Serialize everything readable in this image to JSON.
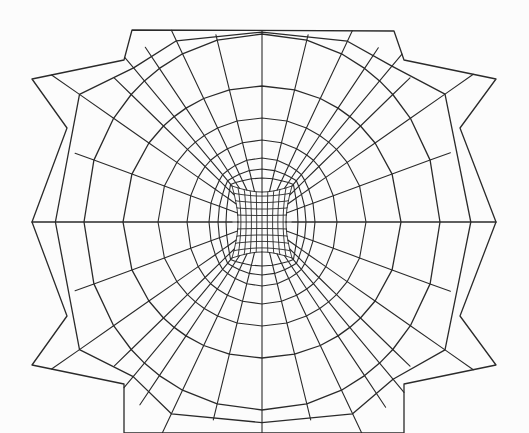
{
  "diagram": {
    "kind": "structured-mesh",
    "canvas": {
      "width": 529,
      "height": 433,
      "background": "#fcfcfc"
    },
    "stroke": {
      "color": "#2a2a2a",
      "outer_width": 1.3,
      "inner_width": 1.1,
      "core_width": 0.9
    },
    "center": {
      "x": 262,
      "y": 222
    },
    "core_block": {
      "x0": 232,
      "x1": 292,
      "y0": 186,
      "y1": 258,
      "divisions_x": 10,
      "divisions_y": 10,
      "side_bulge": 6
    },
    "rings": [
      {
        "rx": 36,
        "ry": 44,
        "squareness": 0.55
      },
      {
        "rx": 44,
        "ry": 53,
        "squareness": 0.25
      },
      {
        "rx": 53,
        "ry": 64,
        "squareness": 0.12
      },
      {
        "rx": 75,
        "ry": 82,
        "squareness": 0.05
      },
      {
        "rx": 104,
        "ry": 104,
        "squareness": 0.0
      },
      {
        "rx": 139,
        "ry": 136,
        "squareness": 0.0
      },
      {
        "rx": 178,
        "ry": 188,
        "squareness": 0.0
      }
    ],
    "spokes_per_quadrant": 8,
    "outer_boundary": {
      "points": [
        [
          32,
          79
        ],
        [
          67,
          128
        ],
        [
          32,
          222
        ],
        [
          67,
          316
        ],
        [
          32,
          365
        ],
        [
          124,
          384
        ],
        [
          124,
          433
        ],
        [
          404,
          433
        ],
        [
          404,
          384
        ],
        [
          496,
          365
        ],
        [
          460,
          316
        ],
        [
          496,
          222
        ],
        [
          460,
          128
        ],
        [
          496,
          79
        ],
        [
          404,
          60
        ],
        [
          394,
          31
        ],
        [
          132,
          30
        ],
        [
          124,
          60
        ]
      ]
    },
    "outer_ring_nodes": {
      "top": [
        [
          132,
          30
        ],
        [
          147,
          30
        ],
        [
          198,
          29
        ],
        [
          234,
          31
        ],
        [
          263,
          28
        ],
        [
          291,
          28
        ],
        [
          329,
          28
        ],
        [
          380,
          29
        ],
        [
          394,
          31
        ]
      ],
      "left_top": [
        [
          124,
          60
        ],
        [
          67,
          128
        ],
        [
          32,
          222
        ]
      ],
      "right_top": [
        [
          404,
          60
        ],
        [
          460,
          128
        ],
        [
          496,
          222
        ]
      ]
    }
  }
}
